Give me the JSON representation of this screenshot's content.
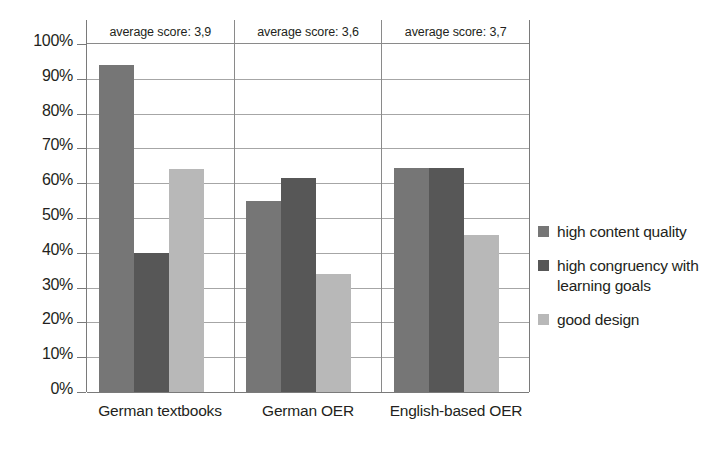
{
  "chart_data": {
    "type": "bar",
    "title": "",
    "subtitle": "",
    "xlabel": "",
    "ylabel": "",
    "categories": [
      "German textbooks",
      "German OER",
      "English-based OER"
    ],
    "series": [
      {
        "name": "high content quality",
        "color": "#767676",
        "values": [
          94,
          55,
          64.5
        ]
      },
      {
        "name": "high congruency with learning goals",
        "color": "#575757",
        "values": [
          40,
          61.5,
          64.5
        ]
      },
      {
        "name": "good design",
        "color": "#b8b8b8",
        "values": [
          64,
          34,
          45
        ]
      }
    ],
    "ylim": [
      0,
      100
    ],
    "y_tick_labels": [
      "100%",
      "90%",
      "80%",
      "70%",
      "60%",
      "50%",
      "40%",
      "30%",
      "20%",
      "10%",
      "0%"
    ],
    "y_tick_values": [
      100,
      90,
      80,
      70,
      60,
      50,
      40,
      30,
      20,
      10,
      0
    ],
    "grid": true,
    "legend_position": "right",
    "annotations": [
      "average score: 3,9",
      "average score: 3,6",
      "average score: 3,7"
    ],
    "annotation_values": [
      3.9,
      3.6,
      3.7
    ]
  }
}
